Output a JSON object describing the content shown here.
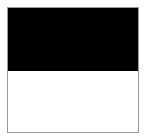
{
  "swatch": {
    "top_color": "#000000",
    "bottom_color": "#ffffff",
    "border_color": "#9a9a9a"
  }
}
